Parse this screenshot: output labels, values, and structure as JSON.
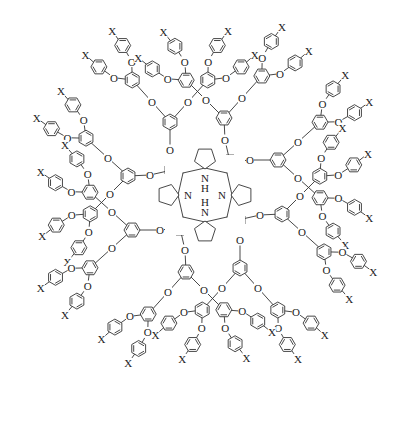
{
  "diagram": {
    "title": "Porphyrin-cored poly(aryl ether) dendrimer",
    "core": {
      "label": "porphyrin",
      "atoms": [
        {
          "text": "N",
          "sub": "H",
          "pos": "top"
        },
        {
          "text": "N",
          "pos": "left"
        },
        {
          "text": "N",
          "pos": "right"
        },
        {
          "text": "N",
          "sub": "H",
          "pos": "bottom"
        }
      ],
      "H_label": "H",
      "N_label": "N"
    },
    "oxygen_label": "O",
    "terminal_label": "X",
    "branches": 4,
    "generation": 3,
    "terminal_groups_per_branch": 8,
    "total_terminal_groups": 32,
    "center": [
      205,
      195
    ]
  }
}
